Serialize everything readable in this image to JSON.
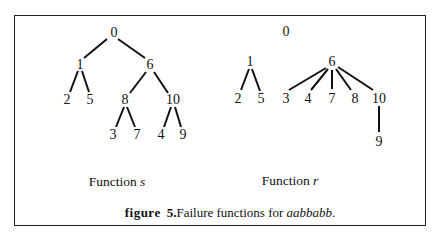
{
  "figure": {
    "caption_prefix": "figure",
    "caption_number": "5.",
    "caption_text": "Failure functions for ",
    "caption_word": "aabbabb",
    "caption_end": "."
  },
  "trees": [
    {
      "id": "function-s",
      "label_prefix": "Function ",
      "label_var": "s",
      "label_pos": [
        117,
        182
      ],
      "nodes": [
        {
          "id": "0",
          "x": 114,
          "y": 33
        },
        {
          "id": "1",
          "x": 80,
          "y": 65
        },
        {
          "id": "6",
          "x": 150,
          "y": 65
        },
        {
          "id": "2",
          "x": 67,
          "y": 100
        },
        {
          "id": "5",
          "x": 90,
          "y": 100
        },
        {
          "id": "8",
          "x": 125,
          "y": 100
        },
        {
          "id": "10",
          "x": 173,
          "y": 100
        },
        {
          "id": "3",
          "x": 113,
          "y": 135
        },
        {
          "id": "7",
          "x": 137,
          "y": 135
        },
        {
          "id": "4",
          "x": 161,
          "y": 135
        },
        {
          "id": "9",
          "x": 183,
          "y": 135
        }
      ],
      "edges": [
        [
          [
            107,
            39
          ],
          [
            84,
            58
          ]
        ],
        [
          [
            118,
            39
          ],
          [
            145,
            58
          ]
        ],
        [
          [
            78,
            71
          ],
          [
            70,
            92
          ]
        ],
        [
          [
            82,
            71
          ],
          [
            89,
            92
          ]
        ],
        [
          [
            146,
            72
          ],
          [
            130,
            93
          ]
        ],
        [
          [
            154,
            72
          ],
          [
            168,
            93
          ]
        ],
        [
          [
            124,
            107
          ],
          [
            116,
            127
          ]
        ],
        [
          [
            127,
            107
          ],
          [
            135,
            127
          ]
        ],
        [
          [
            171,
            107
          ],
          [
            164,
            127
          ]
        ],
        [
          [
            175,
            107
          ],
          [
            181,
            127
          ]
        ]
      ]
    },
    {
      "id": "function-r",
      "label_prefix": "Function ",
      "label_var": "r",
      "label_pos": [
        290,
        181
      ],
      "nodes": [
        {
          "id": "0",
          "x": 286,
          "y": 32
        },
        {
          "id": "1",
          "x": 250,
          "y": 62
        },
        {
          "id": "6",
          "x": 332,
          "y": 62
        },
        {
          "id": "2",
          "x": 238,
          "y": 99
        },
        {
          "id": "5",
          "x": 261,
          "y": 99
        },
        {
          "id": "3",
          "x": 286,
          "y": 99
        },
        {
          "id": "4",
          "x": 308,
          "y": 99
        },
        {
          "id": "7",
          "x": 332,
          "y": 99
        },
        {
          "id": "8",
          "x": 355,
          "y": 99
        },
        {
          "id": "10",
          "x": 379,
          "y": 99
        },
        {
          "id": "9",
          "x": 379,
          "y": 142
        }
      ],
      "edges": [
        [
          [
            249,
            69
          ],
          [
            241,
            90
          ]
        ],
        [
          [
            252,
            69
          ],
          [
            260,
            91
          ]
        ],
        [
          [
            326,
            68
          ],
          [
            289,
            90
          ]
        ],
        [
          [
            328,
            69
          ],
          [
            311,
            90
          ]
        ],
        [
          [
            332,
            70
          ],
          [
            332,
            89
          ]
        ],
        [
          [
            336,
            69
          ],
          [
            351,
            90
          ]
        ],
        [
          [
            338,
            67
          ],
          [
            373,
            90
          ]
        ],
        [
          [
            379,
            106
          ],
          [
            379,
            132
          ]
        ]
      ]
    }
  ]
}
